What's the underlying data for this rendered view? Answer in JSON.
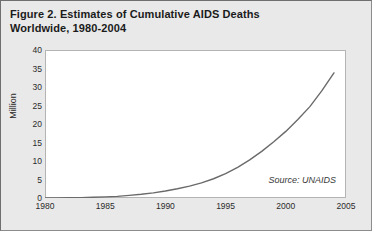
{
  "figure": {
    "title_line1": "Figure 2. Estimates of Cumulative AIDS Deaths",
    "title_line2": "Worldwide, 1980-2004",
    "source_note": "Source: UNAIDS"
  },
  "chart_data": {
    "type": "line",
    "title": "Figure 2. Estimates of Cumulative AIDS Deaths Worldwide, 1980-2004",
    "xlabel": "",
    "ylabel": "Million",
    "xlim": [
      1980,
      2005
    ],
    "ylim": [
      0,
      40
    ],
    "xticks": [
      1980,
      1985,
      1990,
      1995,
      2000,
      2005
    ],
    "yticks": [
      0,
      5,
      10,
      15,
      20,
      25,
      30,
      35,
      40
    ],
    "grid": false,
    "legend": false,
    "line_color": "#6a6a6a",
    "annotations": [
      "Source: UNAIDS"
    ],
    "x": [
      1980,
      1981,
      1982,
      1983,
      1984,
      1985,
      1986,
      1987,
      1988,
      1989,
      1990,
      1991,
      1992,
      1993,
      1994,
      1995,
      1996,
      1997,
      1998,
      1999,
      2000,
      2001,
      2002,
      2003,
      2004
    ],
    "series": [
      {
        "name": "Cumulative AIDS deaths",
        "values": [
          0.0,
          0.0,
          0.05,
          0.1,
          0.2,
          0.3,
          0.45,
          0.7,
          1.0,
          1.4,
          1.9,
          2.5,
          3.2,
          4.1,
          5.2,
          6.6,
          8.3,
          10.3,
          12.6,
          15.2,
          18.0,
          21.2,
          24.7,
          29.0,
          33.8
        ]
      }
    ]
  }
}
